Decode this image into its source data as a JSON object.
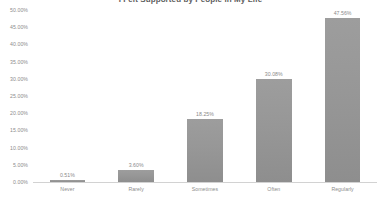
{
  "chart_data": {
    "type": "bar",
    "title": "I Felt Supported by People in My Life",
    "xlabel": "",
    "ylabel": "",
    "categories": [
      "Never",
      "Rarely",
      "Sometimes",
      "Often",
      "Regularly"
    ],
    "values": [
      0.51,
      3.6,
      18.25,
      30.08,
      47.56
    ],
    "value_labels": [
      "0.51%",
      "3.60%",
      "18.25%",
      "30.08%",
      "47.56%"
    ],
    "ylim": [
      0,
      50
    ],
    "ytick_values": [
      0,
      5,
      10,
      15,
      20,
      25,
      30,
      35,
      40,
      45,
      50
    ],
    "ytick_labels": [
      "0.00%",
      "5.00%",
      "10.00%",
      "15.00%",
      "20.00%",
      "25.00%",
      "30.00%",
      "35.00%",
      "40.00%",
      "45.00%",
      "50.00%"
    ],
    "grid": false,
    "legend": false,
    "legend_position": "none",
    "bar_color": "#979797",
    "text_color": "#8c8c8c",
    "axis_color": "#d2d2d2",
    "background_color": "#ffffff"
  }
}
